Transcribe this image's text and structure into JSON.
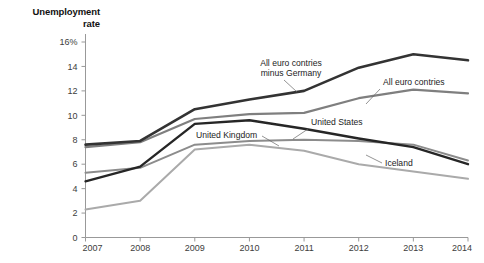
{
  "chart_data": {
    "type": "line",
    "title": "Unemployment\nrate",
    "xlabel": "",
    "ylabel": "Unemployment rate",
    "x": [
      2007,
      2008,
      2009,
      2010,
      2011,
      2012,
      2013,
      2014
    ],
    "xticklabels": [
      "2007",
      "2008",
      "2009",
      "2010",
      "2011",
      "2012",
      "2013",
      "2014"
    ],
    "yticks": [
      0,
      2,
      4,
      6,
      8,
      10,
      12,
      14,
      16
    ],
    "yticklabels": [
      "0",
      "2",
      "4",
      "6",
      "8",
      "10",
      "12",
      "14",
      "16%"
    ],
    "ylim": [
      0,
      16
    ],
    "xlim": [
      2007,
      2014
    ],
    "grid": false,
    "legend": "inline-labels",
    "series": [
      {
        "name": "All euro contries minus Germany",
        "color": "#333333",
        "width": 2.6,
        "values": [
          7.6,
          7.9,
          10.5,
          11.3,
          12.0,
          13.9,
          15.0,
          14.5
        ]
      },
      {
        "name": "All euro contries",
        "color": "#7f7f7f",
        "width": 2.2,
        "values": [
          7.4,
          7.8,
          9.7,
          10.1,
          10.2,
          11.4,
          12.1,
          11.8
        ]
      },
      {
        "name": "United States",
        "color": "#262626",
        "width": 2.4,
        "values": [
          4.6,
          5.8,
          9.3,
          9.6,
          8.9,
          8.1,
          7.4,
          6.0
        ]
      },
      {
        "name": "United Kingdom",
        "color": "#8c8c8c",
        "width": 2.0,
        "values": [
          5.3,
          5.7,
          7.6,
          7.9,
          8.0,
          7.9,
          7.6,
          6.3
        ]
      },
      {
        "name": "Iceland",
        "color": "#aaaaaa",
        "width": 2.0,
        "values": [
          2.3,
          3.0,
          7.2,
          7.6,
          7.1,
          6.0,
          5.4,
          4.8
        ]
      }
    ],
    "annotations": [
      {
        "text_line1": "All euro contries",
        "text_line2": "minus Germany",
        "series": "All euro contries minus Germany",
        "anchor": "middle",
        "lx": 291,
        "ly": 66,
        "lx2": 291,
        "ly2": 76,
        "leader": {
          "x1": 284,
          "y1": 80,
          "x2": 297,
          "y2": 92
        }
      },
      {
        "text_line1": "All euro contries",
        "text_line2": "",
        "series": "All euro contries",
        "anchor": "start",
        "lx": 383,
        "ly": 85,
        "lx2": 0,
        "ly2": 0,
        "leader": {
          "x1": 380,
          "y1": 89,
          "x2": 366,
          "y2": 104
        }
      },
      {
        "text_line1": "United States",
        "text_line2": "",
        "series": "United States",
        "anchor": "start",
        "lx": 311,
        "ly": 125,
        "lx2": 0,
        "ly2": 0,
        "leader": {
          "x1": 308,
          "y1": 129,
          "x2": 293,
          "y2": 139
        }
      },
      {
        "text_line1": "United Kingdom",
        "text_line2": "",
        "series": "United Kingdom",
        "anchor": "start",
        "lx": 196,
        "ly": 138,
        "lx2": 0,
        "ly2": 0,
        "leader": {
          "x1": 262,
          "y1": 136,
          "x2": 279,
          "y2": 146
        }
      },
      {
        "text_line1": "Iceland",
        "text_line2": "",
        "series": "Iceland",
        "anchor": "start",
        "lx": 385,
        "ly": 166,
        "lx2": 0,
        "ly2": 0,
        "leader": {
          "x1": 382,
          "y1": 163,
          "x2": 366,
          "y2": 155
        }
      }
    ],
    "axis_color": "#999999",
    "tick_color": "#999999"
  }
}
